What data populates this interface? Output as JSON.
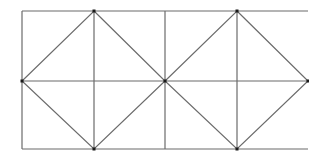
{
  "diagram": {
    "stroke_color": "#6b6b6b",
    "vertex_color": "#1a1a1a",
    "outer_rect": {
      "x1": 22,
      "y1": 11,
      "x2": 308,
      "y2": 149
    },
    "verticals": [
      22,
      94,
      165,
      237
    ],
    "horizontal_mid": 81,
    "diamonds": [
      {
        "top": [
          94,
          11
        ],
        "right": [
          165,
          81
        ],
        "bottom": [
          94,
          149
        ],
        "left": [
          22,
          81
        ]
      },
      {
        "top": [
          237,
          11
        ],
        "right": [
          308,
          81
        ],
        "bottom": [
          237,
          149
        ],
        "left": [
          165,
          81
        ]
      }
    ],
    "vertices": [
      [
        94,
        11
      ],
      [
        94,
        149
      ],
      [
        22,
        81
      ],
      [
        165,
        81
      ],
      [
        237,
        11
      ],
      [
        237,
        149
      ],
      [
        308,
        81
      ]
    ]
  }
}
